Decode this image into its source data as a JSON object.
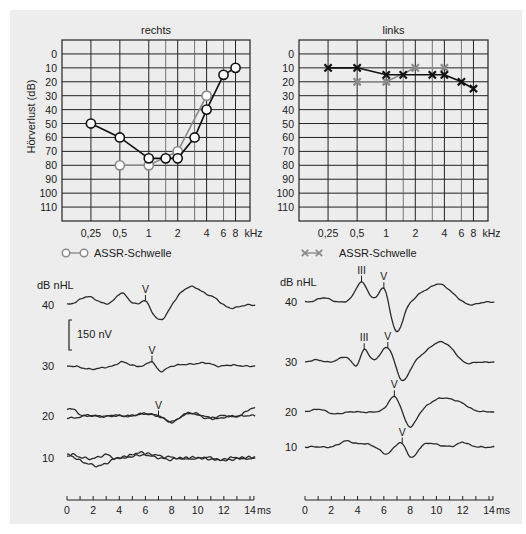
{
  "chart_data": [
    {
      "type": "line",
      "id": "audiogram_right",
      "title": "rechts",
      "xlabel": "kHz",
      "ylabel": "Hörverlust (dB)",
      "x_ticks": [
        "0,25",
        "0,5",
        "1",
        "2",
        "4",
        "6",
        "8"
      ],
      "y_ticks": [
        0,
        10,
        20,
        30,
        40,
        50,
        60,
        70,
        80,
        90,
        100,
        110
      ],
      "ylim": [
        -10,
        120
      ],
      "y_inverted": true,
      "x_scale": "log",
      "grid": true,
      "series": [
        {
          "name": "Reintonaudiogramm (Luftleitung)",
          "marker": "circle",
          "color": "#111111",
          "x": [
            0.25,
            0.5,
            1,
            1.5,
            2,
            3,
            4,
            6,
            8
          ],
          "values": [
            50,
            60,
            75,
            75,
            75,
            60,
            40,
            15,
            10
          ]
        },
        {
          "name": "ASSR-Schwelle",
          "marker": "circle",
          "color": "#8a8a8a",
          "x": [
            0.5,
            1,
            2,
            4
          ],
          "values": [
            80,
            80,
            70,
            30
          ]
        }
      ],
      "legend": [
        {
          "label": "ASSR-Schwelle",
          "marker": "circle",
          "color": "#8a8a8a"
        }
      ]
    },
    {
      "type": "line",
      "id": "audiogram_left",
      "title": "links",
      "xlabel": "kHz",
      "ylabel": "",
      "x_ticks": [
        "0,25",
        "0,5",
        "1",
        "2",
        "4",
        "6",
        "8"
      ],
      "y_ticks": [
        0,
        10,
        20,
        30,
        40,
        50,
        60,
        70,
        80,
        90,
        100,
        110
      ],
      "ylim": [
        -10,
        120
      ],
      "y_inverted": true,
      "x_scale": "log",
      "grid": true,
      "series": [
        {
          "name": "Reintonaudiogramm (Luftleitung)",
          "marker": "x",
          "color": "#111111",
          "x": [
            0.25,
            0.5,
            1,
            1.5,
            3,
            4,
            6,
            8
          ],
          "values": [
            10,
            10,
            15,
            15,
            15,
            15,
            20,
            25
          ]
        },
        {
          "name": "ASSR-Schwelle",
          "marker": "x",
          "color": "#8a8a8a",
          "x": [
            0.5,
            1,
            2,
            4
          ],
          "values": [
            20,
            20,
            10,
            10
          ]
        }
      ],
      "legend": [
        {
          "label": "ASSR-Schwelle",
          "marker": "x",
          "color": "#8a8a8a"
        }
      ]
    },
    {
      "type": "line",
      "id": "abr_right",
      "title": "",
      "ylabel": "dB nHL",
      "xlabel": "ms",
      "x_ticks": [
        0,
        2,
        4,
        6,
        8,
        10,
        12,
        14
      ],
      "xlim": [
        0,
        14.5
      ],
      "scale_bar": "150 nV",
      "traces": [
        {
          "level": 40,
          "peaks": [
            {
              "label": "V",
              "t": 6.0
            }
          ]
        },
        {
          "level": 30,
          "peaks": [
            {
              "label": "V",
              "t": 6.5
            }
          ]
        },
        {
          "level": 20,
          "peaks": [
            {
              "label": "V",
              "t": 7.0
            }
          ],
          "replicates": 2
        },
        {
          "level": 10,
          "peaks": [],
          "replicates": 2
        }
      ]
    },
    {
      "type": "line",
      "id": "abr_left",
      "title": "",
      "ylabel": "dB nHL",
      "xlabel": "ms",
      "x_ticks": [
        0,
        2,
        4,
        6,
        8,
        10,
        12,
        14
      ],
      "xlim": [
        0,
        14.5
      ],
      "traces": [
        {
          "level": 40,
          "peaks": [
            {
              "label": "III",
              "t": 4.3
            },
            {
              "label": "V",
              "t": 6.0
            }
          ]
        },
        {
          "level": 30,
          "peaks": [
            {
              "label": "III",
              "t": 4.5
            },
            {
              "label": "V",
              "t": 6.3
            }
          ]
        },
        {
          "level": 20,
          "peaks": [
            {
              "label": "V",
              "t": 6.8
            }
          ]
        },
        {
          "level": 10,
          "peaks": [
            {
              "label": "V",
              "t": 7.4
            }
          ]
        }
      ]
    }
  ],
  "labels": {
    "right_title": "rechts",
    "left_title": "links",
    "ylabel": "Hörverlust (dB)",
    "khz": "kHz",
    "legend_assr": "ASSR-Schwelle",
    "abr_unit": "dB nHL",
    "scale_bar": "150 nV",
    "ms": "ms",
    "wave_v": "V",
    "wave_iii": "III"
  }
}
